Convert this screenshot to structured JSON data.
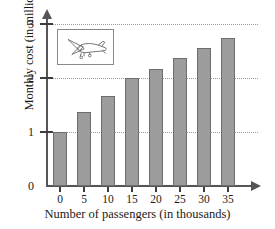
{
  "chart_data": {
    "type": "bar",
    "title": "",
    "xlabel": "Number of passengers (in thousands)",
    "ylabel": "Monthly cost (in millions)",
    "categories": [
      "0",
      "5",
      "10",
      "15",
      "20",
      "25",
      "30",
      "35"
    ],
    "values": [
      1.0,
      1.37,
      1.67,
      2.0,
      2.17,
      2.37,
      2.55,
      2.74
    ],
    "series": [
      {
        "name": "Monthly cost",
        "values": [
          1.0,
          1.37,
          1.67,
          2.0,
          2.17,
          2.37,
          2.55,
          2.74
        ]
      }
    ],
    "ylim": [
      0,
      3
    ],
    "yticks": [
      "0",
      "1",
      "2",
      "3"
    ],
    "ytick_values": [
      0,
      1,
      2,
      3
    ],
    "xtick_labels": [
      "0",
      "5",
      "10",
      "15",
      "20",
      "25",
      "30",
      "35"
    ],
    "grid": "horizontal-dotted",
    "legend": "none",
    "bar_color": "#9c9c9c",
    "bar_border_color": "#6e6e6e",
    "axis_color": "#555555",
    "gridline_color": "#9b9b9b",
    "annotations": [
      {
        "name": "airplane-illustration",
        "kind": "image-inset",
        "description": "airplane"
      }
    ]
  }
}
